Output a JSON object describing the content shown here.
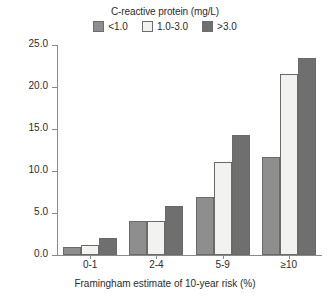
{
  "chart_data": {
    "type": "bar",
    "title": "",
    "legend_title": "C-reactive protein (mg/L)",
    "legend_position": "top-center",
    "categories": [
      "0-1",
      "2-4",
      "5-9",
      "≥10"
    ],
    "series": [
      {
        "name": "<1.0",
        "color": "#8e8e8e",
        "values": [
          1.0,
          4.0,
          6.9,
          11.7
        ]
      },
      {
        "name": "1.0-3.0",
        "color": "#f2f2f0",
        "values": [
          1.2,
          4.0,
          11.1,
          21.5
        ]
      },
      {
        "name": ">3.0",
        "color": "#6f6f6f",
        "values": [
          2.0,
          5.8,
          14.3,
          23.5
        ]
      }
    ],
    "xlabel": "Framingham estimate of 10-year risk (%)",
    "ylabel": "Multivariable relative risk",
    "ylim": [
      0.0,
      25.0
    ],
    "yticks": [
      "0.0",
      "5.0",
      "10.0",
      "15.0",
      "20.0",
      "25.0"
    ],
    "ytick_values": [
      0.0,
      5.0,
      10.0,
      15.0,
      20.0,
      25.0
    ],
    "grid": false,
    "axis_color": "#8a8a8a",
    "bar_edge_color": "#6a6a6a"
  }
}
